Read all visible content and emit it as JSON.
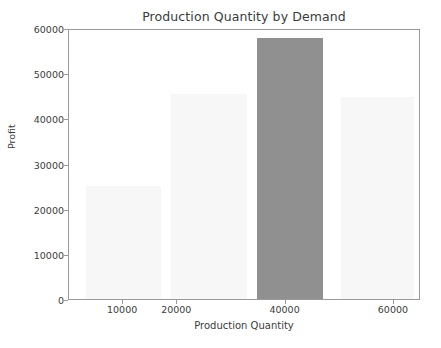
{
  "chart_data": {
    "type": "bar",
    "title": "Production Quantity by Demand",
    "xlabel": "Production Quantity",
    "ylabel": "Profit",
    "categories": [
      "10000",
      "20000",
      "40000",
      "60000"
    ],
    "values": [
      25000,
      45500,
      57800,
      44700
    ],
    "highlight_index": 2,
    "xlim": [
      0,
      65000
    ],
    "ylim": [
      0,
      60000
    ],
    "x_positions": [
      10000,
      20000,
      40000,
      60000
    ],
    "x_tick_labels": [
      "10000",
      "20000",
      "40000",
      "60000"
    ],
    "y_tick_labels": [
      "0",
      "10000",
      "20000",
      "30000",
      "40000",
      "50000",
      "60000"
    ],
    "y_tick_values": [
      0,
      10000,
      20000,
      30000,
      40000,
      50000,
      60000
    ],
    "grid": false,
    "legend": null,
    "bar_color": "#f7f7f7",
    "highlight_color": "#909090",
    "axis_color": "#9a9a9a",
    "text_color": "#3b3b3b",
    "background": "#ffffff",
    "bars": [
      {
        "label": "10000",
        "value": 25000,
        "color": "#f7f7f7",
        "left_px": 85,
        "width_px": 75
      },
      {
        "label": "20000",
        "value": 45500,
        "color": "#f7f7f7",
        "left_px": 170,
        "width_px": 76
      },
      {
        "label": "40000",
        "value": 57800,
        "color": "#909090",
        "left_px": 256,
        "width_px": 66
      },
      {
        "label": "60000",
        "value": 44700,
        "color": "#f7f7f7",
        "left_px": 340,
        "width_px": 73
      }
    ]
  }
}
